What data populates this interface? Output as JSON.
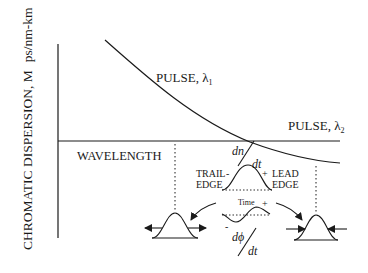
{
  "diagram": {
    "y_axis_label": "CHROMATIC DISPERSION, M",
    "y_axis_units": "ps/nm-km",
    "x_axis_label": "WAVELENGTH",
    "curve_label_1": "PULSE, λ",
    "curve_label_1_sub": "1",
    "curve_label_2": "PULSE, λ",
    "curve_label_2_sub": "2",
    "dn": "dn",
    "dt_top": "dt",
    "trail": "TRAIL",
    "trail_edge": "EDGE",
    "trail_sign": "-",
    "lead": "LEAD",
    "lead_edge": "EDGE",
    "lead_sign": "+",
    "time": "Time",
    "time_plus": "+",
    "time_minus": "-",
    "dphi": "dϕ",
    "dt_bottom": "dt",
    "colors": {
      "line": "#1a1a1a",
      "background": "#ffffff"
    }
  }
}
